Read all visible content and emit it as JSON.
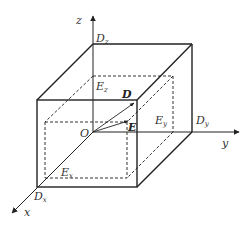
{
  "diagram": {
    "axes": {
      "x": {
        "label": "x"
      },
      "y": {
        "label": "y"
      },
      "z": {
        "label": "z"
      }
    },
    "origin": {
      "label": "O"
    },
    "vectors": [
      {
        "label": "D",
        "style": "bold"
      },
      {
        "label": "E",
        "style": "bold"
      }
    ],
    "outer_box_labels": [
      {
        "main": "D",
        "sub": "z"
      },
      {
        "main": "D",
        "sub": "y"
      },
      {
        "main": "D",
        "sub": "x"
      }
    ],
    "inner_box_labels": [
      {
        "main": "E",
        "sub": "z"
      },
      {
        "main": "E",
        "sub": "y"
      },
      {
        "main": "E",
        "sub": "x"
      }
    ],
    "colors": {
      "line": "#222222",
      "dashed": "#333333",
      "background": "#ffffff"
    }
  }
}
